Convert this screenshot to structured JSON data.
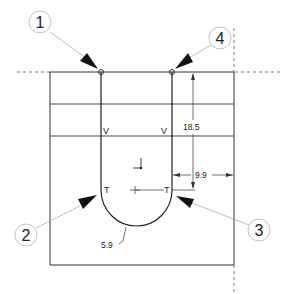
{
  "diagram": {
    "balloons": [
      {
        "label": "1",
        "cx": 40,
        "cy": 22
      },
      {
        "label": "4",
        "cx": 220,
        "cy": 38
      },
      {
        "label": "2",
        "cx": 26,
        "cy": 235
      },
      {
        "label": "3",
        "cx": 259,
        "cy": 230
      }
    ],
    "dimensions": {
      "vertical": "18.5",
      "horizontal": "9.9",
      "radius": "5.9"
    },
    "markers": {
      "v_left": "V",
      "v_right": "V",
      "t_left": "T",
      "t_right": "T"
    },
    "colors": {
      "line": "#333333",
      "leader": "#999999",
      "arrow": "#111111"
    }
  }
}
